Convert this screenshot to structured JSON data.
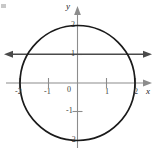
{
  "figure": {
    "axis_labels": {
      "x": "x",
      "y": "y"
    },
    "origin_label": "0",
    "x_ticks": [
      {
        "value": -2,
        "label": "-2"
      },
      {
        "value": -1,
        "label": "-1"
      },
      {
        "value": 1,
        "label": "1"
      },
      {
        "value": 2,
        "label": "2"
      }
    ],
    "y_ticks": [
      {
        "value": 2,
        "label": "2"
      },
      {
        "value": 1,
        "label": "1"
      },
      {
        "value": -1,
        "label": "-1"
      },
      {
        "value": -2,
        "label": "-2"
      }
    ],
    "colors": {
      "axis": "#8c8c8c",
      "curve": "#1a1a1a",
      "line": "#4a4a4a",
      "label": "#3b3b3b",
      "background": "#ffffff"
    }
  },
  "chart_data": {
    "type": "line",
    "title": "",
    "xlabel": "x",
    "ylabel": "y",
    "xlim": [
      -2.9,
      2.9
    ],
    "ylim": [
      -2.9,
      2.9
    ],
    "grid": false,
    "legend": false,
    "series": [
      {
        "name": "circle",
        "kind": "circle",
        "center": [
          0,
          0
        ],
        "radius": 2,
        "equation": "x^2 + y^2 = 4",
        "color": "#1a1a1a"
      },
      {
        "name": "horizontal line",
        "kind": "line",
        "equation": "y = 1",
        "y": 1,
        "x_from": -2.75,
        "x_to": 2.75,
        "arrows": "both",
        "color": "#4a4a4a"
      }
    ],
    "intersections": [
      {
        "x": -1.732,
        "y": 1
      },
      {
        "x": 1.732,
        "y": 1
      }
    ],
    "x_ticks": [
      -2,
      -1,
      1,
      2
    ],
    "y_ticks": [
      -2,
      -1,
      1,
      2
    ]
  }
}
